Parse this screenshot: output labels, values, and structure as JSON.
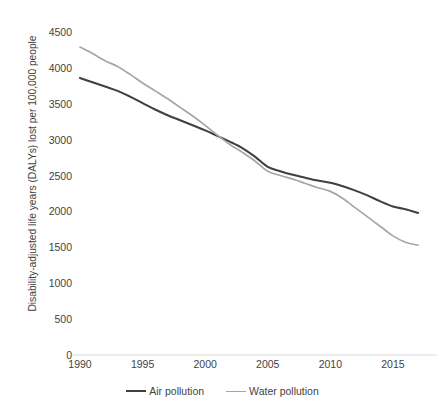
{
  "chart_data": {
    "type": "line",
    "title": "",
    "subtitle": "",
    "xlabel": "",
    "ylabel": "Disability-adjusted life years (DALYs) lost per 100,000 people",
    "xlim": [
      1990,
      2017
    ],
    "ylim": [
      0,
      4500
    ],
    "grid": false,
    "legend_position": "bottom",
    "x_ticks": [
      "1990",
      "1995",
      "2000",
      "2005",
      "2010",
      "2015"
    ],
    "x_tick_values": [
      1990,
      1995,
      2000,
      2005,
      2010,
      2015
    ],
    "y_ticks": [
      "0",
      "500",
      "1000",
      "1500",
      "2000",
      "2500",
      "3000",
      "3500",
      "4000",
      "4500"
    ],
    "y_tick_values": [
      0,
      500,
      1000,
      1500,
      2000,
      2500,
      3000,
      3500,
      4000,
      4500
    ],
    "x": [
      1990,
      1991,
      1992,
      1993,
      1994,
      1995,
      1996,
      1997,
      1998,
      1999,
      2000,
      2001,
      2002,
      2003,
      2004,
      2005,
      2006,
      2007,
      2008,
      2009,
      2010,
      2011,
      2012,
      2013,
      2014,
      2015,
      2016,
      2017
    ],
    "series": [
      {
        "name": "Air pollution",
        "color": "#404040",
        "values": [
          3860,
          3800,
          3740,
          3680,
          3600,
          3510,
          3420,
          3340,
          3270,
          3200,
          3130,
          3050,
          2970,
          2880,
          2760,
          2620,
          2560,
          2510,
          2470,
          2430,
          2400,
          2350,
          2290,
          2220,
          2140,
          2070,
          2030,
          1980
        ]
      },
      {
        "name": "Water pollution",
        "color": "#a6a6a6",
        "values": [
          4290,
          4200,
          4100,
          4020,
          3910,
          3790,
          3680,
          3570,
          3450,
          3330,
          3200,
          3060,
          2930,
          2820,
          2700,
          2560,
          2500,
          2450,
          2390,
          2330,
          2280,
          2180,
          2050,
          1920,
          1790,
          1660,
          1570,
          1530
        ]
      }
    ]
  },
  "legend": {
    "items": [
      {
        "label": "Air pollution",
        "color": "#404040"
      },
      {
        "label": "Water pollution",
        "color": "#a6a6a6"
      }
    ]
  },
  "axis": {
    "baseline_color": "#d9d9d9"
  }
}
